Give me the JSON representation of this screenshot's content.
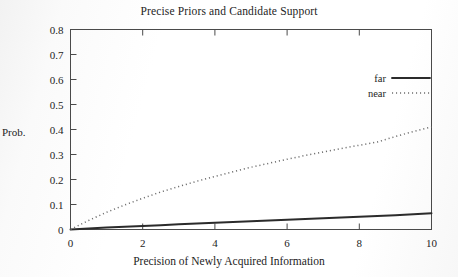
{
  "chart_data": {
    "type": "line",
    "title": "Precise Priors and Candidate Support",
    "xlabel": "Precision of Newly Acquired Information",
    "ylabel": "Prob.",
    "xlim": [
      0,
      10
    ],
    "ylim": [
      0,
      0.8
    ],
    "grid": false,
    "legend_position": "upper-right-inside",
    "xticks": [
      "0",
      "2",
      "4",
      "6",
      "8",
      "10"
    ],
    "xtick_values": [
      0,
      2,
      4,
      6,
      8,
      10
    ],
    "yticks": [
      "0",
      "0.1",
      "0.2",
      "0.3",
      "0.4",
      "0.5",
      "0.6",
      "0.7",
      "0.8"
    ],
    "ytick_values": [
      0,
      0.1,
      0.2,
      0.3,
      0.4,
      0.5,
      0.6,
      0.7,
      0.8
    ],
    "x": [
      0,
      0.5,
      1,
      1.5,
      2,
      2.5,
      3,
      3.5,
      4,
      4.5,
      5,
      5.5,
      6,
      6.5,
      7,
      7.5,
      8,
      8.5,
      9,
      9.5,
      10
    ],
    "series": [
      {
        "name": "far",
        "style": "solid",
        "color": "#2b2b2b",
        "values": [
          0,
          0.004,
          0.008,
          0.011,
          0.014,
          0.017,
          0.021,
          0.024,
          0.027,
          0.03,
          0.033,
          0.036,
          0.039,
          0.042,
          0.045,
          0.048,
          0.051,
          0.054,
          0.057,
          0.061,
          0.065
        ]
      },
      {
        "name": "near",
        "style": "dotted",
        "color": "#6d6d6d",
        "values": [
          0,
          0.036,
          0.069,
          0.098,
          0.125,
          0.15,
          0.172,
          0.193,
          0.212,
          0.231,
          0.249,
          0.265,
          0.281,
          0.296,
          0.31,
          0.324,
          0.337,
          0.35,
          0.372,
          0.392,
          0.41
        ]
      }
    ]
  },
  "legend": {
    "items": [
      {
        "label": "far"
      },
      {
        "label": "near"
      }
    ]
  }
}
